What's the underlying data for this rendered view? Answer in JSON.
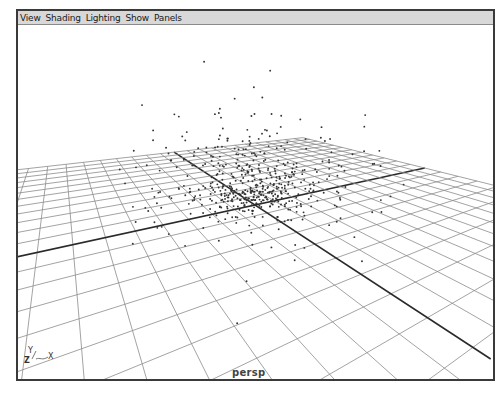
{
  "menubar": {
    "items": [
      {
        "label": "View"
      },
      {
        "label": "Shading"
      },
      {
        "label": "Lighting"
      },
      {
        "label": "Show"
      },
      {
        "label": "Panels"
      }
    ]
  },
  "viewport": {
    "camera_label": "persp",
    "axis_gizmo": {
      "y": "Y",
      "z": "Z",
      "x": "X"
    },
    "content": "perspective grid with particle cloud",
    "colors": {
      "grid": "#8c8c8c",
      "axis_lines": "#2a2a2a",
      "particles": "#333333",
      "background": "#ffffff",
      "menubar_bg": "#d8d8d8"
    }
  }
}
